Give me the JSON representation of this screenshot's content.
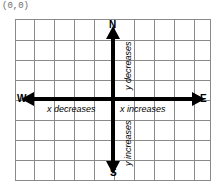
{
  "diagram": {
    "origin_label": "(0,0)",
    "grid": {
      "columns": 10,
      "rows": 8,
      "line_color": "#8a8a8a",
      "background": "#ffffff"
    },
    "axis_color": "#000000",
    "compass": {
      "north": "N",
      "south": "S",
      "east": "E",
      "west": "W"
    },
    "captions": {
      "x_decreases": "x decreases",
      "x_increases": "x increases",
      "y_decreases": "y decreases",
      "y_increases": "y increases"
    },
    "icons": {
      "arrow_north": "arrow-up-icon",
      "arrow_south": "arrow-down-icon",
      "arrow_east": "arrow-right-icon",
      "arrow_west": "arrow-left-icon"
    }
  }
}
